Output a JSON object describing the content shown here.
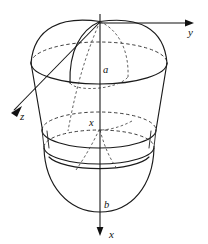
{
  "figure": {
    "kind": "solid-of-revolution-3d-diagram",
    "background_color": "#ffffff",
    "line_color": "#1a1a1a",
    "canvas": {
      "width": 208,
      "height": 244
    }
  },
  "axes": [
    {
      "id": "y-axis",
      "label": "y",
      "direction": "right",
      "label_x": 188,
      "label_y": 36,
      "arrow_tip_x": 194,
      "arrow_tip_y": 23
    },
    {
      "id": "x-axis",
      "label": "x",
      "direction": "down",
      "label_x": 114,
      "label_y": 238,
      "arrow_tip_x": 100,
      "arrow_tip_y": 236
    },
    {
      "id": "z-axis",
      "label": "z",
      "direction": "down-left",
      "label_x": 23,
      "label_y": 117,
      "arrow_tip_x": 11,
      "arrow_tip_y": 106
    }
  ],
  "annotations": [
    {
      "id": "label-a",
      "text": "a",
      "x": 105,
      "y": 72,
      "meaning": "upper-radius-marker"
    },
    {
      "id": "label-b",
      "text": "b",
      "x": 106,
      "y": 207,
      "meaning": "lower-depth-marker"
    },
    {
      "id": "label-x-origin",
      "text": "x",
      "x": 92,
      "y": 125,
      "meaning": "axis-origin-marker"
    }
  ],
  "geometry": {
    "origin": {
      "x": 100,
      "y": 22
    },
    "top_ellipse": {
      "cx": 99,
      "cy": 63,
      "rx": 68,
      "ry": 21
    },
    "mid_ellipse_upper": {
      "cx": 99,
      "cy": 130,
      "rx": 57,
      "ry": 18
    },
    "mid_ellipse_lower": {
      "cx": 99,
      "cy": 147,
      "rx": 55,
      "ry": 17
    },
    "bottom_bowl_depth_y": 212,
    "bottom_bowl_half_width": 57
  }
}
